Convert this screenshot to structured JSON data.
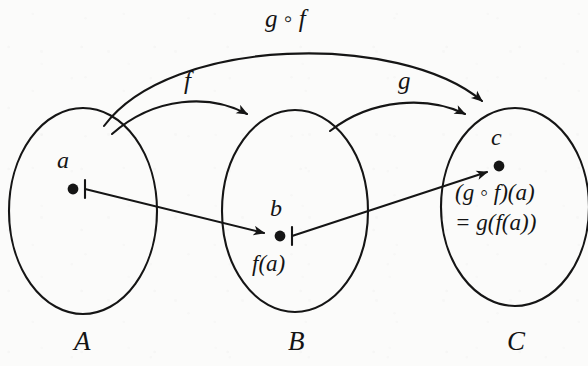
{
  "figure": {
    "ink_color": "#151515",
    "paper_color": "#fbfbfa"
  },
  "sets": [
    {
      "id": "A",
      "label": "A",
      "cx": 83,
      "cy": 211,
      "rx": 74,
      "ry": 103
    },
    {
      "id": "B",
      "label": "B",
      "cx": 295,
      "cy": 211,
      "rx": 73,
      "ry": 101
    },
    {
      "id": "C",
      "label": "C",
      "cx": 515,
      "cy": 207,
      "rx": 74,
      "ry": 99
    }
  ],
  "set_labels": {
    "a_set": "A",
    "b_set": "B",
    "c_set": "C"
  },
  "elements": {
    "a": "a",
    "b": "b",
    "c": "c"
  },
  "values": {
    "b_value": "f(a)",
    "c_value_line1": "(g ◦ f)(a)",
    "c_value_line2": "= g(f(a))"
  },
  "arrows": {
    "f_label": "f",
    "g_label": "g",
    "composite_label": "g ◦ f"
  },
  "maplets": [
    {
      "id": "a-to-b",
      "from": "a",
      "to": "b",
      "style": "maps-to"
    },
    {
      "id": "b-to-c",
      "from": "b",
      "to": "c",
      "style": "maps-to"
    }
  ]
}
